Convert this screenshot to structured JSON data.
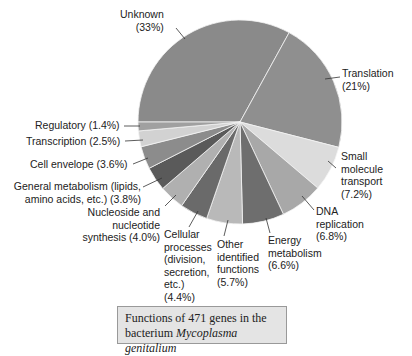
{
  "chart_data": {
    "type": "pie",
    "title": "Functions of 471 genes in the bacterium Mycoplasma genitalium",
    "slices": [
      {
        "label": "Unknown",
        "value": 33,
        "color": "#8a8a8a"
      },
      {
        "label": "Translation",
        "value": 21,
        "color": "#8f8f8f"
      },
      {
        "label": "Small molecule transport",
        "value": 7.2,
        "color": "#dcdcdc"
      },
      {
        "label": "DNA replication",
        "value": 6.8,
        "color": "#a8a8a8"
      },
      {
        "label": "Energy metabolism",
        "value": 6.6,
        "color": "#6e6e6e"
      },
      {
        "label": "Other identified functions",
        "value": 5.7,
        "color": "#b9b9b9"
      },
      {
        "label": "Cellular processes (division, secretion, etc.)",
        "value": 4.4,
        "color": "#6a6a6a"
      },
      {
        "label": "Nucleoside and nucleotide synthesis",
        "value": 4.0,
        "color": "#b0b0b0"
      },
      {
        "label": "General metabolism (lipids, amino acids, etc.)",
        "value": 3.8,
        "color": "#5a5a5a"
      },
      {
        "label": "Cell envelope",
        "value": 3.6,
        "color": "#8c8c8c"
      },
      {
        "label": "Transcription",
        "value": 2.5,
        "color": "#d2d2d2"
      },
      {
        "label": "Regulatory",
        "value": 1.4,
        "color": "#a0a0a0"
      }
    ]
  },
  "labels": {
    "unknown": [
      "Unknown",
      "(33%)"
    ],
    "translation": [
      "Translation",
      "(21%)"
    ],
    "small_molecule": [
      "Small",
      "molecule",
      "transport",
      "(7.2%)"
    ],
    "dna": [
      "DNA",
      "replication",
      "(6.8%)"
    ],
    "energy": [
      "Energy",
      "metabolism",
      "(6.6%)"
    ],
    "other": [
      "Other",
      "identified",
      "functions",
      "(5.7%)"
    ],
    "cellular": [
      "Cellular",
      "processes",
      "(division,",
      "secretion,",
      "etc.)",
      "(4.4%)"
    ],
    "nucleoside": [
      "Nucleoside and",
      "nucleotide",
      "synthesis (4.0%)"
    ],
    "general": [
      "General metabolism (lipids,",
      "amino acids, etc.) (3.8%)"
    ],
    "cell_envelope": "Cell envelope (3.6%)",
    "transcription": "Transcription (2.5%)",
    "regulatory": "Regulatory (1.4%)"
  },
  "caption": {
    "line1": "Functions of 471 genes in the",
    "line2_prefix": "bacterium ",
    "line2_italic": "Mycoplasma genitalium"
  }
}
